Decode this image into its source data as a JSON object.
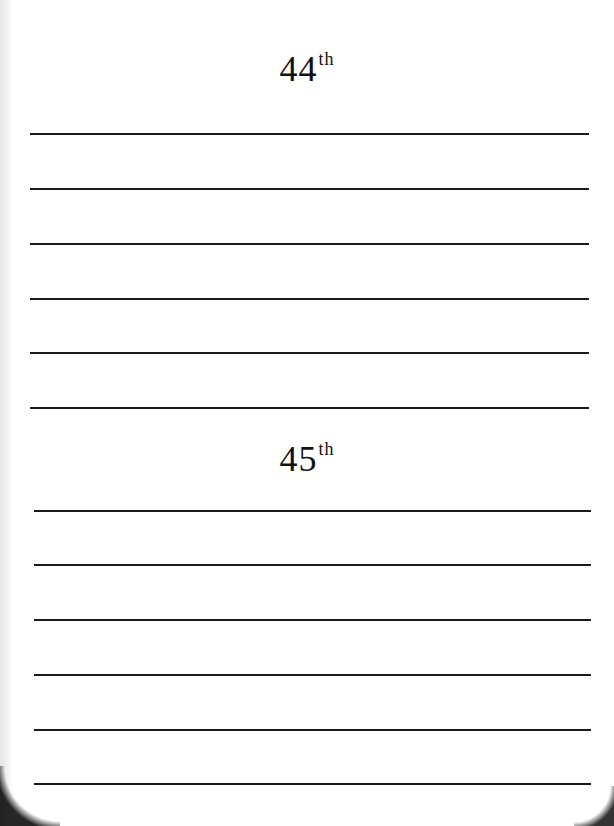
{
  "sections": [
    {
      "number": "44",
      "suffix": "th",
      "heading_top": 48,
      "lines": [
        133,
        188,
        243,
        298,
        352,
        407
      ],
      "line_left": 30,
      "line_right": 589
    },
    {
      "number": "45",
      "suffix": "th",
      "heading_top": 438,
      "lines": [
        510,
        564,
        619,
        674,
        729,
        783
      ],
      "line_left": 34,
      "line_right": 591
    }
  ],
  "colors": {
    "background": "#ffffff",
    "ink": "#1a1a1a"
  }
}
